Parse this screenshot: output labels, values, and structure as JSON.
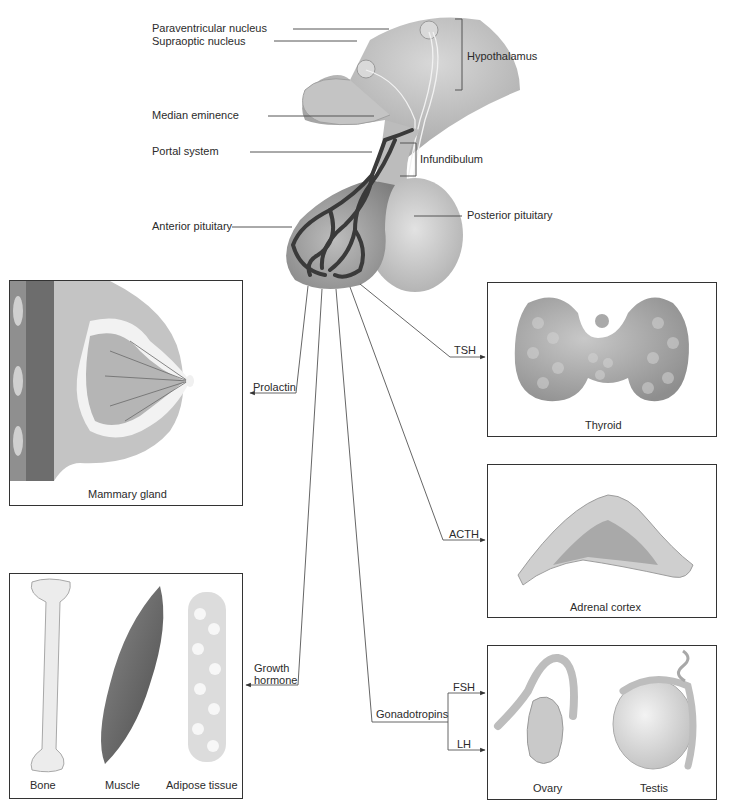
{
  "diagram": {
    "brain_labels": {
      "paraventricular": "Paraventricular nucleus",
      "supraoptic": "Supraoptic nucleus",
      "median_eminence": "Median eminence",
      "portal_system": "Portal system",
      "anterior_pituitary": "Anterior pituitary",
      "hypothalamus": "Hypothalamus",
      "infundibulum": "Infundibulum",
      "posterior_pituitary": "Posterior pituitary"
    },
    "hormones": {
      "prolactin": "Prolactin",
      "tsh": "TSH",
      "acth": "ACTH",
      "growth_hormone_line1": "Growth",
      "growth_hormone_line2": "hormone",
      "gonadotropins": "Gonadotropins",
      "fsh": "FSH",
      "lh": "LH"
    },
    "targets": {
      "mammary": "Mammary gland",
      "thyroid": "Thyroid",
      "adrenal": "Adrenal cortex",
      "bone": "Bone",
      "muscle": "Muscle",
      "adipose": "Adipose tissue",
      "ovary": "Ovary",
      "testis": "Testis"
    },
    "colors": {
      "line": "#555555",
      "box_border": "#333333",
      "tissue_gray": "#b5b5b5",
      "vessel": "#3a3a3a"
    }
  }
}
